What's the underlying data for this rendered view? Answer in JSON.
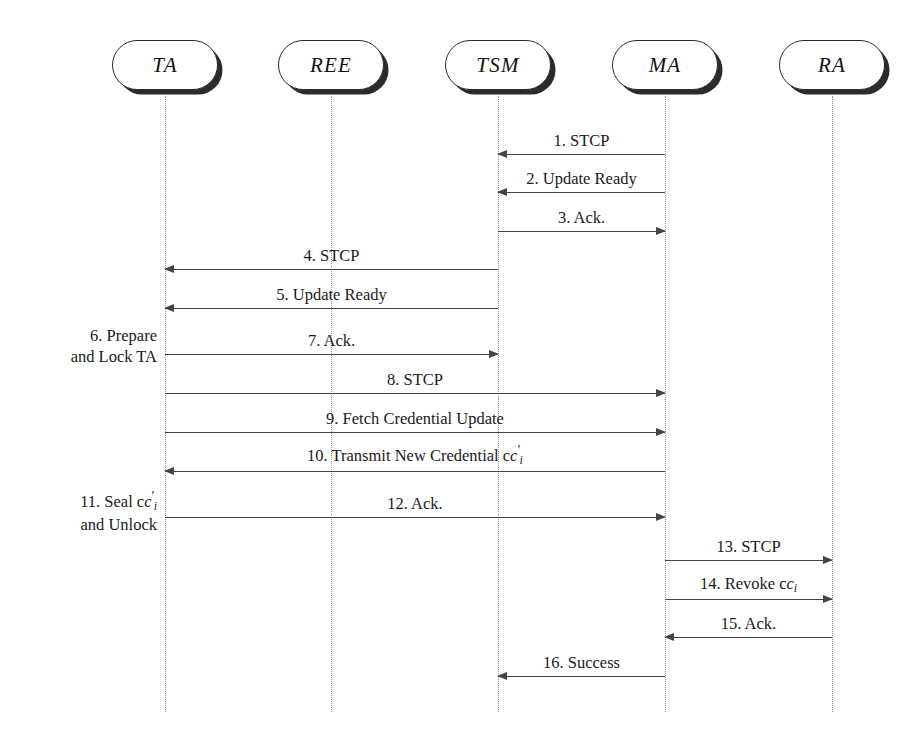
{
  "page": {
    "running_head": "",
    "diagram_type": "uml-sequence-diagram"
  },
  "actors": [
    {
      "id": "TA",
      "label": "TA",
      "x": 165
    },
    {
      "id": "REE",
      "label": "REE",
      "x": 331
    },
    {
      "id": "TSM",
      "label": "TSM",
      "x": 498
    },
    {
      "id": "MA",
      "label": "MA",
      "x": 665
    },
    {
      "id": "RA",
      "label": "RA",
      "x": 832
    }
  ],
  "messages": [
    {
      "num": "1.",
      "label": "1. STCP",
      "from": "MA",
      "to": "TSM",
      "direction": "left",
      "y": 154
    },
    {
      "num": "2.",
      "label": "2. Update Ready",
      "from": "MA",
      "to": "TSM",
      "direction": "left",
      "y": 192
    },
    {
      "num": "3.",
      "label": "3. Ack.",
      "from": "TSM",
      "to": "MA",
      "direction": "right",
      "y": 231
    },
    {
      "num": "4.",
      "label": "4. STCP",
      "from": "TSM",
      "to": "TA",
      "direction": "left",
      "y": 269
    },
    {
      "num": "5.",
      "label": "5. Update Ready",
      "from": "TSM",
      "to": "TA",
      "direction": "left",
      "y": 308
    },
    {
      "num": "7.",
      "label": "7. Ack.",
      "from": "TA",
      "to": "TSM",
      "direction": "right",
      "y": 354
    },
    {
      "num": "8.",
      "label": "8. STCP",
      "from": "TA",
      "to": "MA",
      "direction": "right",
      "y": 393
    },
    {
      "num": "9.",
      "label": "9. Fetch Credential Update",
      "from": "TA",
      "to": "MA",
      "direction": "right",
      "y": 432
    },
    {
      "num": "10.",
      "label": "10. Transmit New Credential c",
      "label_math": "prime_sub_i",
      "from": "MA",
      "to": "TA",
      "direction": "left",
      "y": 471
    },
    {
      "num": "12.",
      "label": "12. Ack.",
      "from": "TA",
      "to": "MA",
      "direction": "right",
      "y": 517
    },
    {
      "num": "13.",
      "label": "13. STCP",
      "from": "MA",
      "to": "RA",
      "direction": "right",
      "y": 560
    },
    {
      "num": "14.",
      "label": "14. Revoke c",
      "label_math": "sub_i",
      "from": "MA",
      "to": "RA",
      "direction": "right",
      "y": 599
    },
    {
      "num": "15.",
      "label": "15. Ack.",
      "from": "RA",
      "to": "MA",
      "direction": "left",
      "y": 637
    },
    {
      "num": "16.",
      "label": "16. Success",
      "from": "MA",
      "to": "TSM",
      "direction": "left",
      "y": 676
    }
  ],
  "notes": [
    {
      "id": "note-6",
      "line1": "6. Prepare",
      "line2": "and Lock TA",
      "y": 325,
      "right": 766
    },
    {
      "id": "note-11",
      "line1": "11. Seal c",
      "line1_math": "prime_sub_i",
      "line2": "and Unlock",
      "y": 488,
      "right": 766
    }
  ],
  "math": {
    "credential_symbol": "c",
    "subscript": "i",
    "prime": "′"
  },
  "style": {
    "line_color": "#444444",
    "lifeline_color": "#9a9a9a",
    "box_border": "#2b2b2b",
    "background": "#ffffff"
  },
  "geometry": {
    "box_top": 40,
    "box_width": 106,
    "box_height": 50,
    "lifeline_top": 96,
    "lifeline_bottom": 712
  }
}
